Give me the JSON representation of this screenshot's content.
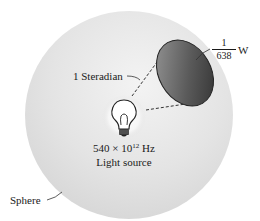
{
  "diagram": {
    "sphere_label": "Sphere",
    "solid_angle_label": "1 Steradian",
    "power": {
      "numerator": "1",
      "denominator": "638",
      "unit": "W"
    },
    "source": {
      "frequency_base": "540 × 10",
      "frequency_exponent": "12",
      "frequency_unit": " Hz",
      "label": "Light source"
    },
    "icons": [
      "light-bulb-icon"
    ],
    "colors": {
      "sphere": "#e4e4e4",
      "patch_dark": "#3c3c3c",
      "patch_light": "#9a9a9a",
      "text": "#1a1a1a"
    }
  }
}
